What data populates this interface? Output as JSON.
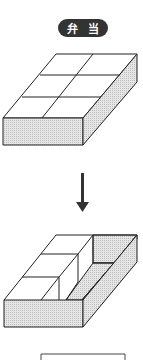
{
  "title": {
    "chars": [
      "弁",
      "当"
    ]
  },
  "colors": {
    "stroke": "#222222",
    "shade": "#d9d9d9",
    "pill": "#333333",
    "pill_text": "#ffffff"
  },
  "figures": {
    "before": "closed lunch box with 6-compartment lid (2 x 3 grid)",
    "transition": "down-arrow",
    "after": "open lunch box with 3 blocks inside and empty right channel"
  }
}
